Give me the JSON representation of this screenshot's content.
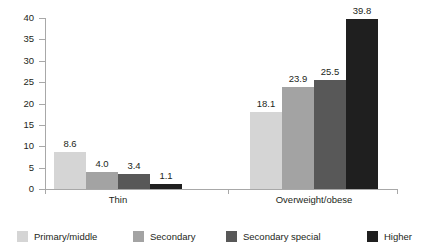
{
  "chart_data": {
    "type": "bar",
    "title": "",
    "subtitle": "",
    "xlabel": "",
    "ylabel": "",
    "categories": [
      "Thin",
      "Overweight/obese"
    ],
    "series": [
      {
        "name": "Primary/middle",
        "color": "#d5d5d5",
        "values": [
          8.6,
          18.1
        ],
        "labels": [
          "8.6",
          "18.1"
        ]
      },
      {
        "name": "Secondary",
        "color": "#a3a3a3",
        "values": [
          4.0,
          23.9
        ],
        "labels": [
          "4.0",
          "23.9"
        ]
      },
      {
        "name": "Secondary special",
        "color": "#585858",
        "values": [
          3.4,
          25.5
        ],
        "labels": [
          "3.4",
          "25.5"
        ]
      },
      {
        "name": "Higher",
        "color": "#1f1f1f",
        "values": [
          1.1,
          39.8
        ],
        "labels": [
          "1.1",
          "39.8"
        ]
      }
    ],
    "ylim": [
      0,
      40
    ],
    "ytick_step": 5,
    "ytick_labels": [
      "40",
      "35",
      "30",
      "25",
      "20",
      "15",
      "10",
      "5",
      "0"
    ],
    "ytick_values": [
      40,
      35,
      30,
      25,
      20,
      15,
      10,
      5,
      0
    ],
    "grid": false,
    "legend_position": "bottom",
    "axis_color": "#a8a8a8",
    "text_color": "#231f20",
    "background": "#ffffff"
  }
}
